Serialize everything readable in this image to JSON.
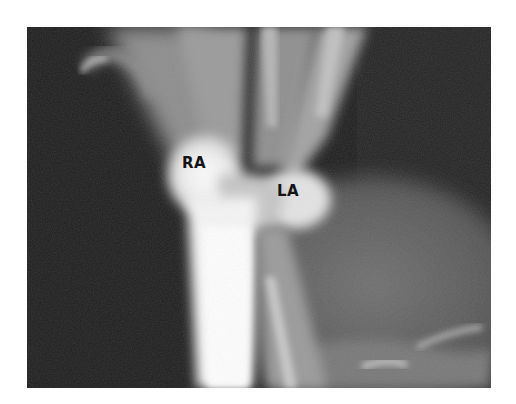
{
  "image": {
    "type": "radiograph",
    "description": "Contrast angiogram showing opacified right atrium and left atrium with venous inflow",
    "colors": {
      "background": "#1c1c1c",
      "contrast_bright": "#f4f4f4",
      "soft_tissue": "#6a6a6a",
      "page": "#ffffff"
    }
  },
  "labels": {
    "ra": "RA",
    "la": "LA"
  }
}
